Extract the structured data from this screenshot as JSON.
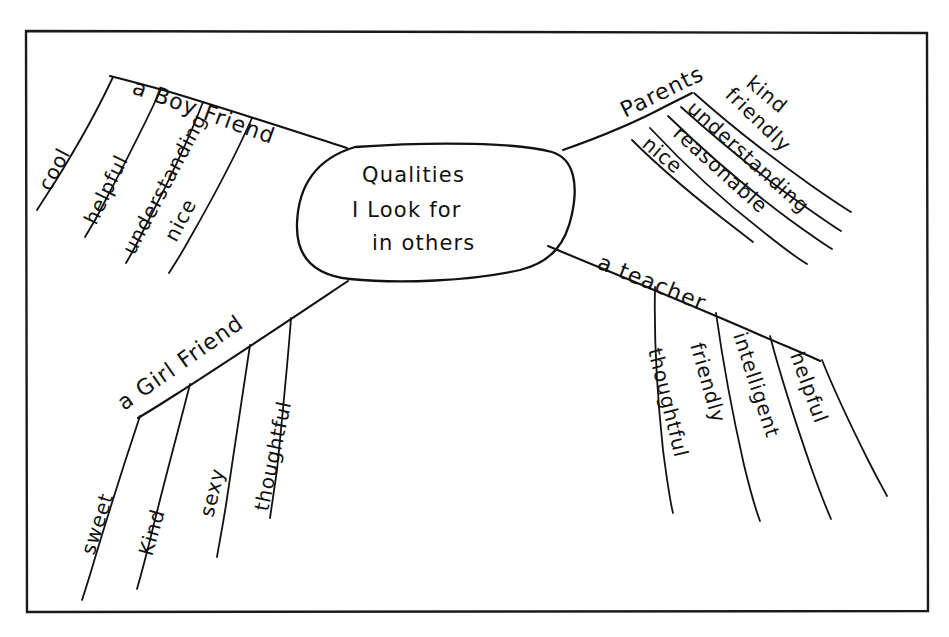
{
  "document": {
    "kind": "hand-drawn-mind-map",
    "background_color": "#ffffff",
    "ink_color": "#121212",
    "frame": {
      "name": "page-border",
      "x": 25,
      "y": 30,
      "width": 903,
      "height": 582
    }
  },
  "center": {
    "name": "central-topic",
    "lines": [
      "Qualities",
      "I Look for",
      "in others"
    ],
    "line1": "Qualities",
    "line2": "I Look for",
    "line3": "in others"
  },
  "branches": [
    {
      "id": "boy-friend",
      "label": "a Boy Friend",
      "position": "upper-left",
      "leaves": [
        "cool",
        "helpful",
        "understanding",
        "nice"
      ],
      "leaf1": "cool",
      "leaf2": "helpful",
      "leaf3": "understanding",
      "leaf4": "nice"
    },
    {
      "id": "parents",
      "label": "Parents",
      "position": "upper-right",
      "leaves": [
        "kind",
        "friendly",
        "understanding",
        "reasonable",
        "nice"
      ],
      "leaf1": "kind",
      "leaf2": "friendly",
      "leaf3": "understanding",
      "leaf4": "reasonable",
      "leaf5": "nice"
    },
    {
      "id": "girl-friend",
      "label": "a Girl Friend",
      "position": "lower-left",
      "leaves": [
        "sweet",
        "Kind",
        "sexy",
        "thoughtful"
      ],
      "leaf1": "sweet",
      "leaf2": "Kind",
      "leaf3": "sexy",
      "leaf4": "thoughtful"
    },
    {
      "id": "teacher",
      "label": "a teacher",
      "position": "lower-right",
      "leaves": [
        "helpful",
        "intelligent",
        "friendly",
        "thoughtful"
      ],
      "leaf1": "helpful",
      "leaf2": "intelligent",
      "leaf3": "friendly",
      "leaf4": "thoughtful"
    }
  ]
}
